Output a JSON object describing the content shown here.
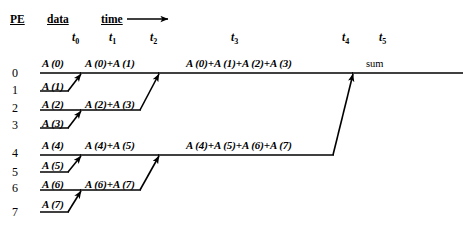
{
  "headers": {
    "pe": "PE",
    "data": "data",
    "time": "time",
    "time_arrow": "right-arrow"
  },
  "time_steps": [
    {
      "label": "t",
      "sub": "0",
      "x": 72
    },
    {
      "label": "t",
      "sub": "1",
      "x": 109
    },
    {
      "label": "t",
      "sub": "2",
      "x": 150
    },
    {
      "label": "t",
      "sub": "3",
      "x": 231
    },
    {
      "label": "t",
      "sub": "4",
      "x": 342
    },
    {
      "label": "t",
      "sub": "5",
      "x": 379
    }
  ],
  "pe_rows": [
    {
      "id": "0",
      "y": 66
    },
    {
      "id": "1",
      "y": 83
    },
    {
      "id": "2",
      "y": 101
    },
    {
      "id": "3",
      "y": 118
    },
    {
      "id": "4",
      "y": 146
    },
    {
      "id": "5",
      "y": 165
    },
    {
      "id": "6",
      "y": 181
    },
    {
      "id": "7",
      "y": 205
    }
  ],
  "stage0_labels": [
    {
      "text": "A (0)",
      "x": 42,
      "y": 57
    },
    {
      "text": "A (1)",
      "x": 42,
      "y": 80
    },
    {
      "text": "A (2)",
      "x": 42,
      "y": 98
    },
    {
      "text": "A (3)",
      "x": 42,
      "y": 117
    },
    {
      "text": "A (4)",
      "x": 42,
      "y": 139
    },
    {
      "text": "A (5)",
      "x": 42,
      "y": 159
    },
    {
      "text": "A (6)",
      "x": 42,
      "y": 178
    },
    {
      "text": "A (7)",
      "x": 42,
      "y": 198
    }
  ],
  "stage1_labels": [
    {
      "text": "A (0)+A (1)",
      "x": 85,
      "y": 57
    },
    {
      "text": "A (2)+A (3)",
      "x": 85,
      "y": 98
    },
    {
      "text": "A (4)+A (5)",
      "x": 85,
      "y": 139
    },
    {
      "text": "A (6)+A (7)",
      "x": 85,
      "y": 178
    }
  ],
  "stage2_labels": [
    {
      "text": "A (0)+A (1)+A (2)+A (3)",
      "x": 186,
      "y": 57
    },
    {
      "text": "A (4)+A (5)+A (6)+A (7)",
      "x": 186,
      "y": 139
    }
  ],
  "stage3_labels": [
    {
      "text": "sum",
      "x": 366,
      "y": 58
    }
  ],
  "wires": {
    "note": "horizontal PE data lines and diagonal merge arrows",
    "horizontal_lines": [
      {
        "name": "pe0-t0",
        "x1": 40,
        "x2": 80,
        "y": 73
      },
      {
        "name": "pe1-t0",
        "x1": 40,
        "x2": 68,
        "y": 91
      },
      {
        "name": "pe2-t0",
        "x1": 40,
        "x2": 80,
        "y": 110
      },
      {
        "name": "pe3-t0",
        "x1": 40,
        "x2": 68,
        "y": 128
      },
      {
        "name": "pe4-t0",
        "x1": 40,
        "x2": 80,
        "y": 155
      },
      {
        "name": "pe5-t0",
        "x1": 40,
        "x2": 68,
        "y": 172
      },
      {
        "name": "pe6-t0",
        "x1": 40,
        "x2": 80,
        "y": 190
      },
      {
        "name": "pe7-t0",
        "x1": 40,
        "x2": 68,
        "y": 212
      },
      {
        "name": "pe0-t1",
        "x1": 80,
        "x2": 158,
        "y": 73
      },
      {
        "name": "pe2-t1",
        "x1": 80,
        "x2": 140,
        "y": 110
      },
      {
        "name": "pe4-t1",
        "x1": 80,
        "x2": 158,
        "y": 155
      },
      {
        "name": "pe6-t1",
        "x1": 80,
        "x2": 140,
        "y": 190
      },
      {
        "name": "pe0-t2",
        "x1": 158,
        "x2": 352,
        "y": 73
      },
      {
        "name": "pe4-t2",
        "x1": 158,
        "x2": 333,
        "y": 155
      },
      {
        "name": "pe0-t4",
        "x1": 352,
        "x2": 463,
        "y": 73
      }
    ],
    "diagonal_arrows": [
      {
        "name": "pe1-to-pe0",
        "x1": 68,
        "y1": 91,
        "x2": 80,
        "y2": 73
      },
      {
        "name": "pe3-to-pe2",
        "x1": 68,
        "y1": 128,
        "x2": 80,
        "y2": 110
      },
      {
        "name": "pe5-to-pe4",
        "x1": 68,
        "y1": 172,
        "x2": 80,
        "y2": 155
      },
      {
        "name": "pe7-to-pe6",
        "x1": 68,
        "y1": 212,
        "x2": 80,
        "y2": 190
      },
      {
        "name": "pe2-to-pe0",
        "x1": 140,
        "y1": 110,
        "x2": 158,
        "y2": 73
      },
      {
        "name": "pe6-to-pe4",
        "x1": 140,
        "y1": 190,
        "x2": 158,
        "y2": 155
      },
      {
        "name": "pe4-to-pe0",
        "x1": 333,
        "y1": 155,
        "x2": 352,
        "y2": 73
      }
    ]
  }
}
